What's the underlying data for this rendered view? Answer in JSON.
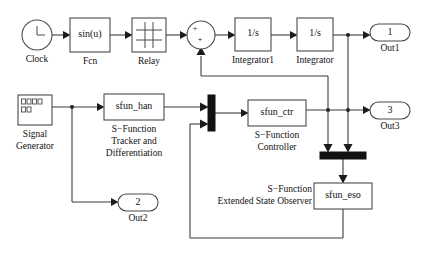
{
  "diagram": {
    "type": "block-diagram",
    "canvas": {
      "width": 425,
      "height": 253,
      "background": "#ffffff"
    },
    "line_color": "#3d3d3d",
    "block_stroke": "#4a4a4a",
    "mux_color": "#111111"
  },
  "blocks": {
    "clock": {
      "name": "clock",
      "icon": "clock-icon",
      "label": "Clock",
      "shape": "circle",
      "x": 22,
      "y": 20,
      "w": 30,
      "h": 30
    },
    "fcn": {
      "name": "fcn",
      "text": "sin(u)",
      "label": "Fcn",
      "shape": "rect",
      "x": 70,
      "y": 18,
      "w": 40,
      "h": 34
    },
    "relay": {
      "name": "relay",
      "icon": "hysteresis-icon",
      "label": "Relay",
      "shape": "rect",
      "x": 132,
      "y": 18,
      "w": 34,
      "h": 34
    },
    "sum": {
      "name": "sum",
      "label": "",
      "signs": [
        "+",
        "+"
      ],
      "shape": "circle",
      "x": 187,
      "y": 21,
      "w": 28,
      "h": 28
    },
    "integrator1": {
      "name": "integrator1",
      "text": "1/s",
      "label": "Integrator1",
      "shape": "rect",
      "x": 235,
      "y": 18,
      "w": 36,
      "h": 33
    },
    "integrator": {
      "name": "integrator",
      "text": "1/s",
      "label": "Integrator",
      "shape": "rect",
      "x": 297,
      "y": 18,
      "w": 36,
      "h": 33
    },
    "signal_generator": {
      "name": "signal-generator",
      "icon": "waveform-icon",
      "label": "Signal\nGenerator",
      "label_line1": "Signal",
      "label_line2": "Generator",
      "shape": "rect",
      "x": 18,
      "y": 95,
      "w": 34,
      "h": 30
    },
    "sfun_han": {
      "name": "sfun-han",
      "text": "sfun_han",
      "label_line1": "S−Function",
      "label_line2": "Tracker and",
      "label_line3": "Differentiation",
      "shape": "rect",
      "x": 104,
      "y": 94,
      "w": 60,
      "h": 26
    },
    "mux_vertical": {
      "name": "mux-vertical",
      "inputs": 2,
      "orientation": "vertical",
      "x": 208,
      "y": 95,
      "w": 7,
      "h": 36
    },
    "sfun_ctr": {
      "name": "sfun-ctr",
      "text": "sfun_ctr",
      "label_line1": "S−Function",
      "label_line2": "Controller",
      "shape": "rect",
      "x": 248,
      "y": 100,
      "w": 58,
      "h": 26
    },
    "mux_horizontal": {
      "name": "mux-horizontal",
      "inputs": 2,
      "orientation": "horizontal",
      "x": 320,
      "y": 152,
      "w": 46,
      "h": 7
    },
    "sfun_eso": {
      "name": "sfun-eso",
      "text": "sfun_eso",
      "label_line1": "S−Function",
      "label_line2": "Extended State Observer",
      "shape": "rect",
      "x": 314,
      "y": 183,
      "w": 58,
      "h": 26
    }
  },
  "ports": {
    "out1": {
      "name": "out1",
      "number": "1",
      "label": "Out1",
      "x": 370,
      "y": 24,
      "w": 40,
      "h": 17
    },
    "out3": {
      "name": "out3",
      "number": "3",
      "label": "Out3",
      "x": 370,
      "y": 102,
      "w": 40,
      "h": 17
    },
    "out2": {
      "name": "out2",
      "number": "2",
      "label": "Out2",
      "x": 118,
      "y": 194,
      "w": 40,
      "h": 17
    }
  },
  "labels": {
    "clock": "Clock",
    "fcn": "Fcn",
    "relay": "Relay",
    "integrator1": "Integrator1",
    "integrator": "Integrator",
    "signal_generator_l1": "Signal",
    "signal_generator_l2": "Generator",
    "sfun_han_l1": "S−Function",
    "sfun_han_l2": "Tracker and",
    "sfun_han_l3": "Differentiation",
    "sfun_ctr_l1": "S−Function",
    "sfun_ctr_l2": "Controller",
    "sfun_eso_l1": "S−Function",
    "sfun_eso_l2": "Extended State Observer",
    "out1": "Out1",
    "out2": "Out2",
    "out3": "Out3"
  },
  "block_text": {
    "fcn": "sin(u)",
    "integrator1": "1/s",
    "integrator": "1/s",
    "sfun_han": "sfun_han",
    "sfun_ctr": "sfun_ctr",
    "sfun_eso": "sfun_eso",
    "sum_plus_top": "+",
    "sum_plus_bottom": "+",
    "out1_num": "1",
    "out2_num": "2",
    "out3_num": "3"
  }
}
